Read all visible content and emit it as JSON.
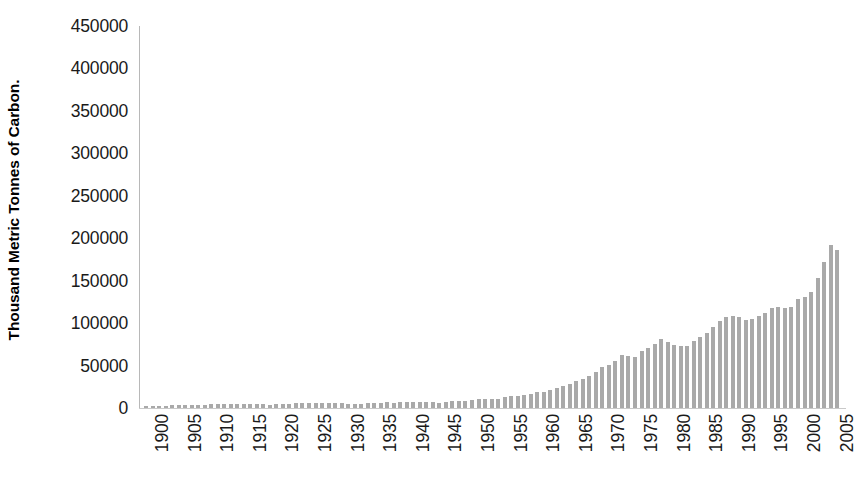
{
  "chart_data": {
    "type": "bar",
    "title": "",
    "subtitle": "",
    "xlabel": "",
    "ylabel": "Thousand Metric Tonnes of Carbon.",
    "ylim": [
      0,
      450000
    ],
    "ytick_step": 50000,
    "ytick_labels": [
      "450000",
      "400000",
      "350000",
      "300000",
      "250000",
      "200000",
      "150000",
      "100000",
      "50000",
      "0"
    ],
    "ytick_values": [
      450000,
      400000,
      350000,
      300000,
      250000,
      200000,
      150000,
      100000,
      50000,
      0
    ],
    "xtick_labels": [
      "1900",
      "1905",
      "1910",
      "1915",
      "1920",
      "1925",
      "1930",
      "1935",
      "1940",
      "1945",
      "1950",
      "1955",
      "1960",
      "1965",
      "1970",
      "1975",
      "1980",
      "1985",
      "1990",
      "1995",
      "2000",
      "2005"
    ],
    "xtick_values": [
      1900,
      1905,
      1910,
      1915,
      1920,
      1925,
      1930,
      1935,
      1940,
      1945,
      1950,
      1955,
      1960,
      1965,
      1970,
      1975,
      1980,
      1985,
      1990,
      1995,
      2000,
      2005
    ],
    "grid": false,
    "legend": false,
    "legend_position": "none",
    "bar_color": "#a9a9a9",
    "axis_color": "#bfbfbf",
    "background_color": "#ffffff",
    "x": [
      1900,
      1901,
      1902,
      1903,
      1904,
      1905,
      1906,
      1907,
      1908,
      1909,
      1910,
      1911,
      1912,
      1913,
      1914,
      1915,
      1916,
      1917,
      1918,
      1919,
      1920,
      1921,
      1922,
      1923,
      1924,
      1925,
      1926,
      1927,
      1928,
      1929,
      1930,
      1931,
      1932,
      1933,
      1934,
      1935,
      1936,
      1937,
      1938,
      1939,
      1940,
      1941,
      1942,
      1943,
      1944,
      1945,
      1946,
      1947,
      1948,
      1949,
      1950,
      1951,
      1952,
      1953,
      1954,
      1955,
      1956,
      1957,
      1958,
      1959,
      1960,
      1961,
      1962,
      1963,
      1964,
      1965,
      1966,
      1967,
      1968,
      1969,
      1970,
      1971,
      1972,
      1973,
      1974,
      1975,
      1976,
      1977,
      1978,
      1979,
      1980,
      1981,
      1982,
      1983,
      1984,
      1985,
      1986,
      1987,
      1988,
      1989,
      1990,
      1991,
      1992,
      1993,
      1994,
      1995,
      1996,
      1997,
      1998,
      1999,
      2000,
      2001,
      2002,
      2003,
      2004,
      2005,
      2006
    ],
    "values": [
      534000,
      1895,
      1950,
      2043,
      2060,
      2122,
      2200,
      2389,
      2346,
      2427,
      2552,
      2591,
      2712,
      2858,
      2682,
      2620,
      2810,
      2856,
      2758,
      2484,
      2750,
      2415,
      2593,
      2936,
      2903,
      2989,
      2921,
      3120,
      3096,
      3260,
      3008,
      2773,
      2589,
      2721,
      2900,
      3054,
      3275,
      3475,
      3415,
      3571,
      3730,
      3806,
      3861,
      3948,
      3983,
      3524,
      3667,
      4041,
      4164,
      4127,
      4425,
      4755,
      4797,
      4861,
      4872,
      5277,
      5557,
      5713,
      5810,
      6044,
      6476,
      6486,
      6691,
      7071,
      7406,
      7658,
      8030,
      8250,
      8665,
      9156,
      9619,
      9903,
      10294,
      10975,
      10895,
      10778,
      11420,
      11705,
      12143,
      12636,
      12397,
      11992,
      11797,
      11792,
      12203,
      12492,
      12787,
      13239,
      13731,
      13956,
      13945,
      13852,
      13566,
      13644,
      13844,
      14102,
      14470,
      14552,
      14477,
      14550,
      14980,
      15050,
      15300,
      16120,
      16950,
      17480,
      18600
    ],
    "values_display_note": "Annual global fossil-fuel CO2 emissions, thousand metric tonnes of carbon",
    "plot_heights_px": [
      2,
      2,
      2,
      2,
      3,
      3,
      3,
      3,
      3,
      3,
      4,
      4,
      4,
      4,
      4,
      4,
      4,
      4,
      4,
      3,
      4,
      4,
      4,
      5,
      5,
      5,
      5,
      5,
      5,
      5,
      5,
      4,
      4,
      4,
      5,
      5,
      5,
      6,
      5,
      6,
      6,
      6,
      6,
      6,
      6,
      5,
      6,
      7,
      7,
      7,
      8,
      9,
      9,
      9,
      9,
      11,
      12,
      12,
      13,
      14,
      16,
      16,
      18,
      20,
      22,
      24,
      27,
      29,
      32,
      36,
      41,
      43,
      47,
      53,
      52,
      51,
      57,
      60,
      64,
      69,
      66,
      63,
      62,
      62,
      67,
      71,
      75,
      81,
      87,
      91,
      92,
      91,
      88,
      89,
      92,
      95,
      100,
      101,
      100,
      101,
      109,
      111,
      116,
      130,
      146,
      163,
      158
    ],
    "value_readings": {
      "note": "bar heights read off the axis, thousand metric tonnes of carbon",
      "1900": 2500,
      "1910": 4500,
      "1920": 5000,
      "1930": 6000,
      "1940": 7000,
      "1950": 9500,
      "1960": 19000,
      "1970": 48000,
      "1975": 61000,
      "1980": 79000,
      "1985": 85000,
      "1990": 110000,
      "1995": 113000,
      "2000": 130000,
      "2005": 340000,
      "2006": 382000
    }
  }
}
